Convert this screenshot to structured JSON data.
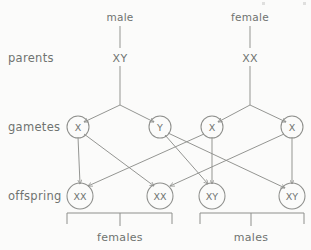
{
  "diagram": {
    "stroke_color": "#8e8f8c",
    "text_color": "#6f7370",
    "background_color": "#fbfbfa"
  },
  "stage_labels": {
    "parents": "parents",
    "gametes": "gametes",
    "offspring": "offspring"
  },
  "parents": [
    {
      "sex_label": "male",
      "genotype": "XY",
      "x": 120
    },
    {
      "sex_label": "female",
      "genotype": "XX",
      "x": 250
    }
  ],
  "gametes": [
    {
      "allele": "X",
      "x": 78,
      "parent": "male"
    },
    {
      "allele": "Y",
      "x": 160,
      "parent": "male"
    },
    {
      "allele": "X",
      "x": 212,
      "parent": "female"
    },
    {
      "allele": "X",
      "x": 292,
      "parent": "female"
    }
  ],
  "offspring": [
    {
      "genotype": "XX",
      "x": 80,
      "sex": "female"
    },
    {
      "genotype": "XX",
      "x": 160,
      "sex": "female"
    },
    {
      "genotype": "XY",
      "x": 212,
      "sex": "male"
    },
    {
      "genotype": "XY",
      "x": 292,
      "sex": "male"
    }
  ],
  "group_labels": {
    "females": "females",
    "males": "males"
  },
  "fertilization_links": [
    {
      "from": "male-X",
      "to": "offspring-XX-1"
    },
    {
      "from": "male-X",
      "to": "offspring-XX-2"
    },
    {
      "from": "male-Y",
      "to": "offspring-XY-1"
    },
    {
      "from": "male-Y",
      "to": "offspring-XY-2"
    },
    {
      "from": "female-X-1",
      "to": "offspring-XX-1"
    },
    {
      "from": "female-X-1",
      "to": "offspring-XY-1"
    },
    {
      "from": "female-X-2",
      "to": "offspring-XX-2"
    },
    {
      "from": "female-X-2",
      "to": "offspring-XY-2"
    }
  ]
}
